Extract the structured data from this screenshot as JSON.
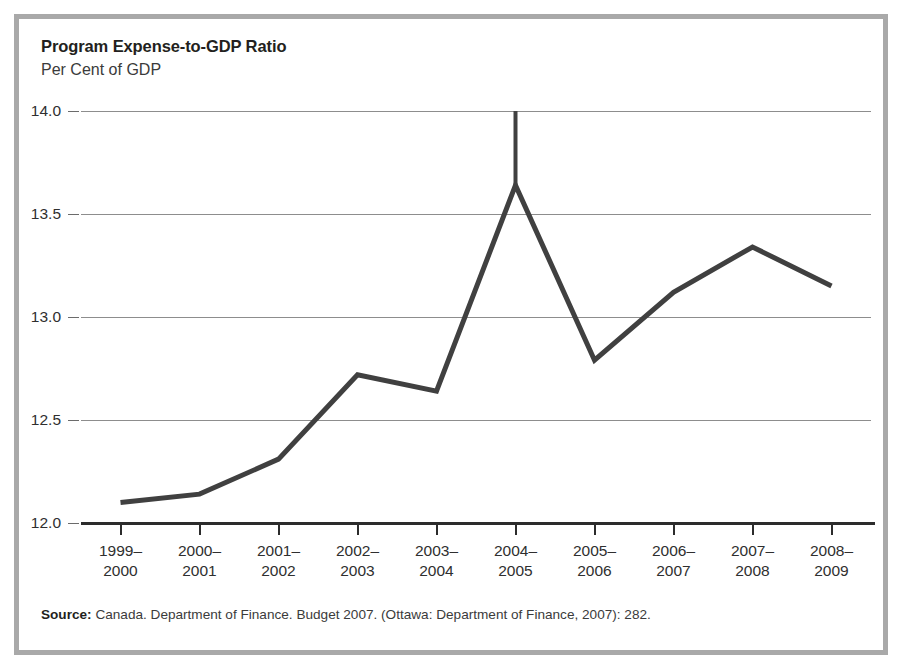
{
  "figure": {
    "title": "Program Expense-to-GDP Ratio",
    "subtitle": "Per Cent of GDP",
    "source_label": "Source:",
    "source_text": " Canada. Department of Finance. Budget 2007. (Ottawa: Department of Finance, 2007): 282.",
    "border_color": "#a9a9a9",
    "line_color": "#404040",
    "grid_color": "#8d8d8d",
    "axis_color": "#2c2c2c"
  },
  "chart_data": {
    "type": "line",
    "title": "Program Expense-to-GDP Ratio",
    "subtitle": "Per Cent of GDP",
    "xlabel": "",
    "ylabel": "Per Cent of GDP",
    "ylim": [
      12.0,
      14.0
    ],
    "ytick_values": [
      12.0,
      12.5,
      13.0,
      13.5,
      14.0
    ],
    "ytick_labels": [
      "12.0",
      "12.5",
      "13.0",
      "13.5",
      "14.0"
    ],
    "grid": true,
    "legend": "none",
    "categories": [
      "1999–2000",
      "2000–2001",
      "2001–2002",
      "2002–2003",
      "2003–2004",
      "2004–2005",
      "2005–2006",
      "2006–2007",
      "2007–2008",
      "2008–2009"
    ],
    "category_lines": [
      [
        "1999–",
        "2000"
      ],
      [
        "2000–",
        "2001"
      ],
      [
        "2001–",
        "2002"
      ],
      [
        "2002–",
        "2003"
      ],
      [
        "2003–",
        "2004"
      ],
      [
        "2004–",
        "2005"
      ],
      [
        "2005–",
        "2006"
      ],
      [
        "2006–",
        "2007"
      ],
      [
        "2007–",
        "2008"
      ],
      [
        "2008–",
        "2009"
      ]
    ],
    "values": [
      12.1,
      12.14,
      12.31,
      12.72,
      12.64,
      13.64,
      12.79,
      13.12,
      13.34,
      13.15
    ],
    "annotations": [
      {
        "type": "vertical-line",
        "at_category": "2004–2005",
        "from_value": 13.64,
        "to_value": 14.0
      }
    ]
  }
}
